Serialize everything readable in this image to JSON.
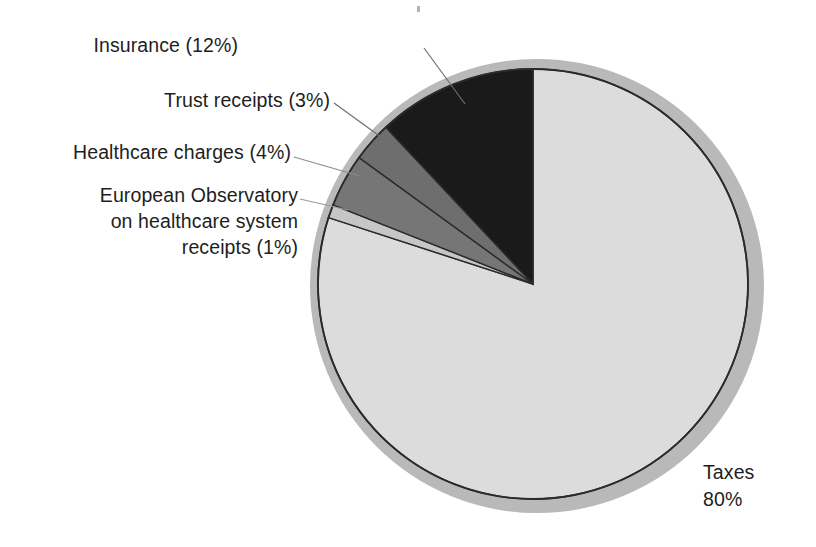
{
  "figure": {
    "background": "#ffffff",
    "pie_fill_taxes": "#dcdcdc",
    "pie_fill_observatory": "#c6c6c6",
    "pie_fill_healthcare": "#767676",
    "pie_fill_trust": "#6e6e6e",
    "pie_fill_insurance": "#1a1a1a",
    "pie_outline": "#2b2b2b",
    "shadow_ring": "#b9b9b9",
    "leader_line": "#6f6f6f"
  },
  "labels": {
    "insurance": "Insurance (12%)",
    "trust": "Trust receipts (3%)",
    "healthcare": "Healthcare charges (4%)",
    "observatory": "European Observatory\non healthcare system\nreceipts (1%)",
    "taxes": "Taxes\n80%"
  },
  "chart_data": {
    "type": "pie",
    "title": "",
    "categories": [
      "Insurance",
      "Trust receipts",
      "Healthcare charges",
      "European Observatory on healthcare system receipts",
      "Taxes"
    ],
    "values": [
      12,
      3,
      4,
      1,
      80
    ],
    "value_unit": "%",
    "labels": [
      "Insurance (12%)",
      "Trust receipts (3%)",
      "Healthcare charges (4%)",
      "European Observatory on healthcare system receipts (1%)",
      "Taxes 80%"
    ],
    "colors": [
      "#1a1a1a",
      "#6e6e6e",
      "#767676",
      "#c6c6c6",
      "#dcdcdc"
    ],
    "start_angle_deg": 90,
    "direction": "counterclockwise",
    "legend": "none",
    "grid": false,
    "total": 100
  }
}
